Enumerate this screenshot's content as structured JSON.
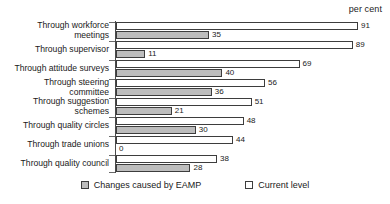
{
  "chart_data": {
    "type": "bar",
    "orientation": "horizontal",
    "title": "",
    "unit_caption": "per cent",
    "xlabel": "",
    "ylabel": "",
    "xlim": [
      0,
      91
    ],
    "grid": false,
    "legend_position": "bottom-center",
    "categories": [
      "Through workforce\nmeetings",
      "Through supervisor",
      "Through attitude surveys",
      "Through steering\ncommittee",
      "Through suggestion\nschemes",
      "Through quality circles",
      "Through trade unions",
      "Through quality council"
    ],
    "series": [
      {
        "name": "Current level",
        "color": "#ffffff",
        "values": [
          91,
          89,
          69,
          56,
          51,
          48,
          44,
          38
        ]
      },
      {
        "name": "Changes caused by EAMP",
        "color": "#bdbdbd",
        "values": [
          35,
          11,
          40,
          36,
          21,
          30,
          0,
          28
        ]
      }
    ]
  },
  "legend": {
    "items": [
      {
        "label": "Changes caused by EAMP",
        "swatch": "changes"
      },
      {
        "label": "Current level",
        "swatch": "current"
      }
    ]
  }
}
